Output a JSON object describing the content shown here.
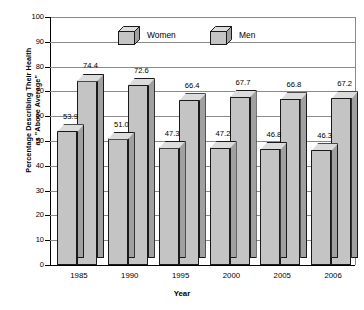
{
  "chart_data": {
    "type": "bar",
    "title": "",
    "xlabel": "Year",
    "ylabel": "Percentage Describing Their Health\nas \"Above Average\"",
    "categories": [
      "1985",
      "1990",
      "1995",
      "2000",
      "2005",
      "2006"
    ],
    "series": [
      {
        "name": "Women",
        "values": [
          53.9,
          51.0,
          47.3,
          47.2,
          46.8,
          46.3
        ]
      },
      {
        "name": "Men",
        "values": [
          74.4,
          72.6,
          66.4,
          67.7,
          66.8,
          67.2
        ]
      }
    ],
    "ylim": [
      0,
      100
    ],
    "yticks": [
      0,
      10,
      20,
      30,
      40,
      50,
      60,
      70,
      80,
      90,
      100
    ],
    "ytick_labels": [
      "0",
      "10",
      "20",
      "30",
      "40",
      "50",
      "60",
      "70",
      "80",
      "90",
      "100"
    ],
    "grid": true,
    "legend_position": "top-center-inside",
    "data_labels": [
      "53.9",
      "74.4",
      "51.0",
      "72.6",
      "47.3",
      "66.4",
      "47.2",
      "67.7",
      "46.8",
      "66.8",
      "46.3",
      "67.2"
    ],
    "style": "3d-bars",
    "colors": {
      "bar_front": "#c4c4c4",
      "bar_side": "#a0a0a0",
      "bar_top": "#dcdcdc",
      "bar_outline": "#1a1a1a",
      "gridline": "#8a8a8a",
      "axis": "#000000",
      "background": "#ffffff",
      "text": "#000000"
    }
  },
  "legend": {
    "items": [
      {
        "label": "Women",
        "icon": "cube-3d-icon"
      },
      {
        "label": "Men",
        "icon": "cube-3d-icon"
      }
    ]
  },
  "axes": {
    "y_title_line1": "Percentage Describing Their Health",
    "y_title_line2": "as \"Above Average\"",
    "x_title": "Year"
  }
}
